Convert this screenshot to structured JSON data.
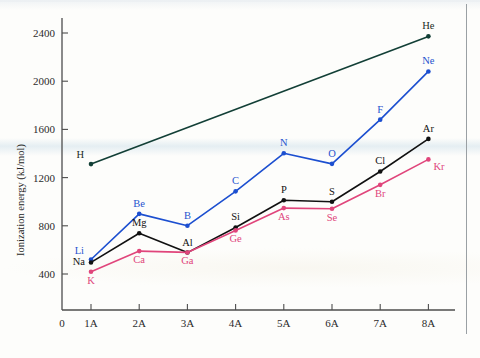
{
  "figure": {
    "background_color": "#fdfdfb",
    "axis_color": "#4d4d4d"
  },
  "chart_data": {
    "type": "line",
    "title": "",
    "xlabel": "",
    "ylabel": "Ionization energy (kJ/mol)",
    "x": [
      "1A",
      "2A",
      "3A",
      "4A",
      "5A",
      "6A",
      "7A",
      "8A"
    ],
    "x_origin_label": "0",
    "xtick_labels": [
      "0",
      "1A",
      "2A",
      "3A",
      "4A",
      "5A",
      "6A",
      "7A",
      "8A"
    ],
    "ytick_labels": [
      "400",
      "800",
      "1200",
      "1600",
      "2000",
      "2400"
    ],
    "ytick_values": [
      400,
      800,
      1200,
      1600,
      2000,
      2400
    ],
    "ylim": [
      200,
      2560
    ],
    "grid": false,
    "legend": "none",
    "series": [
      {
        "name": "Period 1-2",
        "color": "#123f36",
        "point_color": "#123f36",
        "label_color": "#1b2b24",
        "x": [
          "1A",
          "8A"
        ],
        "values": [
          1312,
          2372
        ],
        "point_labels": [
          "H",
          "He"
        ],
        "label_positions": [
          "above-left",
          "above"
        ]
      },
      {
        "name": "Period 2",
        "color": "#1c4fd0",
        "point_color": "#1c4fd0",
        "label_color": "#2653cf",
        "x": [
          "1A",
          "2A",
          "3A",
          "4A",
          "5A",
          "6A",
          "7A",
          "8A"
        ],
        "values": [
          520,
          899,
          801,
          1086,
          1402,
          1314,
          1681,
          2081
        ],
        "point_labels": [
          "Li",
          "Be",
          "B",
          "C",
          "N",
          "O",
          "F",
          "Ne"
        ],
        "label_positions": [
          "above-left",
          "above",
          "above",
          "above",
          "above",
          "above",
          "above",
          "above"
        ]
      },
      {
        "name": "Period 3",
        "color": "#111111",
        "point_color": "#111111",
        "label_color": "#111111",
        "x": [
          "1A",
          "2A",
          "3A",
          "4A",
          "5A",
          "6A",
          "7A",
          "8A"
        ],
        "values": [
          496,
          738,
          578,
          786,
          1012,
          1000,
          1251,
          1521
        ],
        "point_labels": [
          "Na",
          "Mg",
          "Al",
          "Si",
          "P",
          "S",
          "Cl",
          "Ar"
        ],
        "label_positions": [
          "left",
          "above",
          "above",
          "above",
          "above",
          "above",
          "above",
          "above"
        ]
      },
      {
        "name": "Period 4",
        "color": "#e0457b",
        "point_color": "#e0457b",
        "label_color": "#e0457b",
        "x": [
          "1A",
          "2A",
          "3A",
          "4A",
          "5A",
          "6A",
          "7A",
          "8A"
        ],
        "values": [
          419,
          590,
          579,
          762,
          947,
          941,
          1140,
          1351
        ],
        "point_labels": [
          "K",
          "Ca",
          "Ga",
          "Ge",
          "As",
          "Se",
          "Br",
          "Kr"
        ],
        "label_positions": [
          "below",
          "below",
          "below",
          "below",
          "below",
          "below",
          "below",
          "above-right"
        ]
      }
    ]
  }
}
